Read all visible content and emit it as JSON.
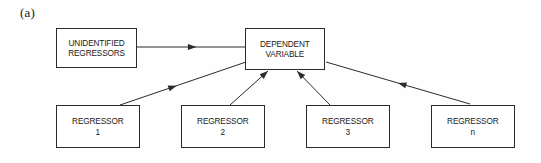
{
  "figure": {
    "panel_label": "(a)",
    "background_color": "#fefefe",
    "line_color": "#2b2b2b",
    "width": 541,
    "height": 163
  },
  "nodes": {
    "unidentified_regressors": {
      "label": "UNIDENTIFIED\nREGRESSORS",
      "x": 56,
      "y": 28,
      "w": 81,
      "h": 40
    },
    "dependent_variable": {
      "label": "DEPENDENT\nVARIABLE",
      "x": 245,
      "y": 28,
      "w": 80,
      "h": 42
    },
    "regressor_1": {
      "label": "REGRESSOR\n1",
      "x": 56,
      "y": 105,
      "w": 84,
      "h": 43
    },
    "regressor_2": {
      "label": "REGRESSOR\n2",
      "x": 181,
      "y": 105,
      "w": 84,
      "h": 43
    },
    "regressor_3": {
      "label": "REGRESSOR\n3",
      "x": 306,
      "y": 105,
      "w": 84,
      "h": 43
    },
    "regressor_n": {
      "label": "REGRESSOR\nn",
      "x": 431,
      "y": 105,
      "w": 84,
      "h": 43
    }
  },
  "edges": [
    {
      "name": "unidentified-regressors-to-dependent-variable",
      "from": "unidentified_regressors",
      "to": "dependent_variable",
      "x1": 137,
      "y1": 47,
      "x2": 245,
      "y2": 47,
      "arrowhead_at": 0.55
    },
    {
      "name": "regressor-1-to-dependent-variable",
      "from": "regressor_1",
      "to": "dependent_variable",
      "x1": 120,
      "y1": 105,
      "x2": 246,
      "y2": 62,
      "arrowhead_at": 0.45
    },
    {
      "name": "regressor-2-to-dependent-variable",
      "from": "regressor_2",
      "to": "dependent_variable",
      "x1": 230,
      "y1": 105,
      "x2": 268,
      "y2": 71,
      "arrowhead_at": 1.0
    },
    {
      "name": "regressor-3-to-dependent-variable",
      "from": "regressor_3",
      "to": "dependent_variable",
      "x1": 330,
      "y1": 105,
      "x2": 297,
      "y2": 71,
      "arrowhead_at": 1.0
    },
    {
      "name": "regressor-n-to-dependent-variable",
      "from": "regressor_n",
      "to": "dependent_variable",
      "x1": 470,
      "y1": 104,
      "x2": 326,
      "y2": 62,
      "arrowhead_at": 0.5
    }
  ]
}
